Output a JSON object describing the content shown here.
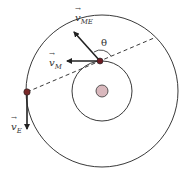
{
  "diagram": {
    "title": "",
    "labels": {
      "v_ME": {
        "base": "v",
        "sub": "ME"
      },
      "v_M": {
        "base": "v",
        "sub": "M"
      },
      "v_E": {
        "base": "v",
        "sub": "E"
      },
      "theta": "θ"
    },
    "colors": {
      "stroke": "#222222",
      "planet": "#6b1a22",
      "sun_fill": "#d9b8bd",
      "sun_stroke": "#333333"
    },
    "elements": {
      "sun": {
        "cx": 102,
        "cy": 91,
        "r": 6
      },
      "mars_orbit": {
        "cx": 102,
        "cy": 91,
        "r": 30
      },
      "earth_orbit": {
        "cx": 102,
        "cy": 91,
        "r": 76
      },
      "mars": {
        "cx": 100,
        "cy": 61,
        "r": 3
      },
      "earth": {
        "cx": 27,
        "cy": 92,
        "r": 3
      }
    }
  }
}
